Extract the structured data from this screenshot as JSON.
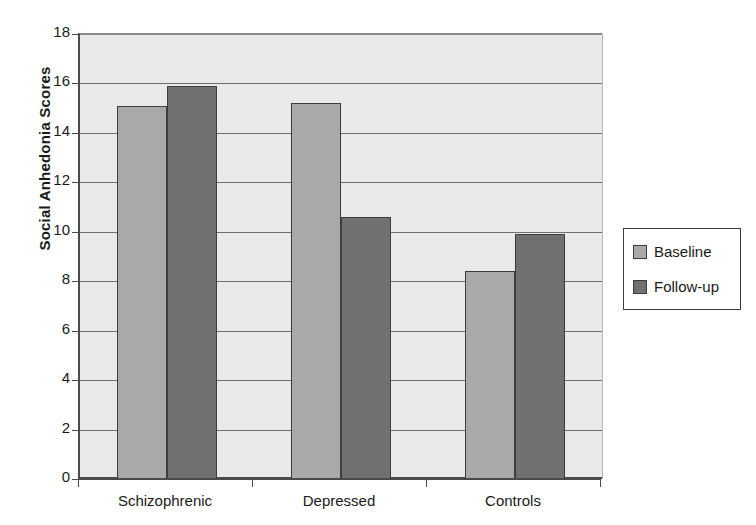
{
  "chart_data": {
    "type": "bar",
    "title": "",
    "xlabel": "",
    "ylabel": "Social Anhedonia Scores",
    "categories": [
      "Schizophrenic",
      "Depressed",
      "Controls"
    ],
    "series": [
      {
        "name": "Baseline",
        "values": [
          15.1,
          15.2,
          8.4
        ],
        "color": "#a9a9a9"
      },
      {
        "name": "Follow-up",
        "values": [
          15.9,
          10.6,
          9.9
        ],
        "color": "#707070"
      }
    ],
    "ylim": [
      0,
      18
    ],
    "ytick_values": [
      0,
      2,
      4,
      6,
      8,
      10,
      12,
      14,
      16,
      18
    ],
    "ytick_labels": [
      "0",
      "2",
      "4",
      "6",
      "8",
      "10",
      "12",
      "14",
      "16",
      "18"
    ],
    "grid": true,
    "legend_position": "right",
    "plot_background": "#e9e9e9",
    "gridline_color": "#6e6e6e",
    "axis_color": "#4a4a4a"
  },
  "legend": {
    "entries": [
      {
        "label": "Baseline"
      },
      {
        "label": "Follow-up"
      }
    ]
  }
}
